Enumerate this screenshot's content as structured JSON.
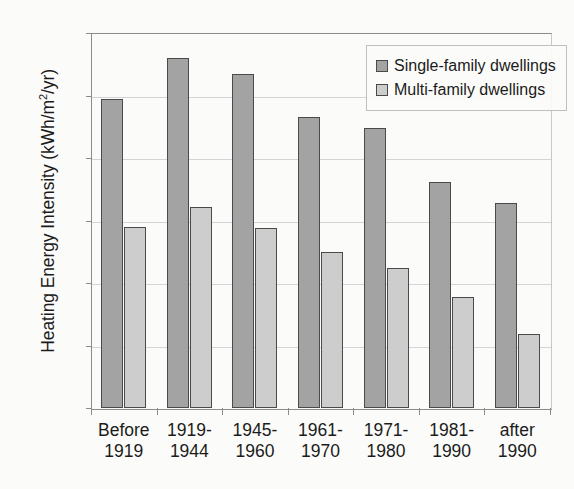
{
  "chart_data": {
    "type": "bar",
    "title": "",
    "xlabel": "",
    "ylabel": "Heating Energy Intensity (kWh/m2/yr)",
    "ylabel_parts": {
      "main": "Heating Energy Intensity (kWh/m",
      "sup": "2",
      "tail": "/yr)"
    },
    "categories": [
      "Before 1919",
      "1919-1944",
      "1945-1960",
      "1961-1970",
      "1971-1980",
      "1981-1990",
      "after 1990"
    ],
    "category_lines": [
      [
        "Before",
        "1919"
      ],
      [
        "1919-",
        "1944"
      ],
      [
        "1945-",
        "1960"
      ],
      [
        "1961-",
        "1970"
      ],
      [
        "1971-",
        "1980"
      ],
      [
        "1981-",
        "1990"
      ],
      [
        "after",
        "1990"
      ]
    ],
    "series": [
      {
        "name": "Single-family dwellings",
        "color": "#a3a3a3",
        "values": [
          247,
          280,
          267,
          233,
          224,
          181,
          164
        ]
      },
      {
        "name": "Multi-family dwellings",
        "color": "#cdcdcd",
        "values": [
          145,
          161,
          144,
          125,
          112,
          89,
          59
        ]
      }
    ],
    "ylim": [
      0,
      300
    ],
    "yticks": [
      0,
      50,
      100,
      150,
      200,
      250,
      300
    ],
    "ytick_labels": [
      "0",
      "50",
      "100",
      "150",
      "200",
      "250",
      "300"
    ],
    "grid": "horizontal",
    "legend_position": "top-right",
    "legend_entries": [
      "Single-family dwellings",
      "Multi-family dwellings"
    ]
  },
  "style": {
    "background": "#fbfbf9",
    "axis_color": "#8b8b8b",
    "gridline_color": "#d4d4d4",
    "bar_border": "#4a4a4a",
    "text_color": "#1b1b1b"
  }
}
